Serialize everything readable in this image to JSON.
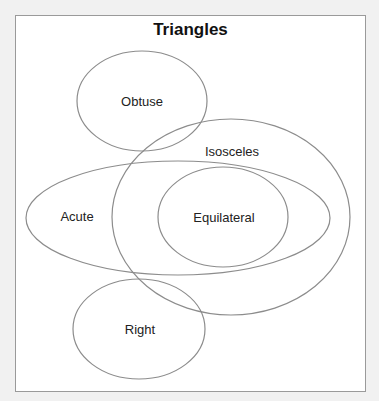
{
  "diagram": {
    "title": "Triangles",
    "type": "venn",
    "stroke_color": "#8c8c8c",
    "sets": [
      {
        "id": "obtuse",
        "label": "Obtuse",
        "cx": 142,
        "cy": 101,
        "rx": 65,
        "ry": 50,
        "label_x": 142,
        "label_y": 101
      },
      {
        "id": "isosceles",
        "label": "Isosceles",
        "cx": 231,
        "cy": 217,
        "rx": 119,
        "ry": 98,
        "label_x": 232,
        "label_y": 151
      },
      {
        "id": "acute",
        "label": "Acute",
        "cx": 178,
        "cy": 218,
        "rx": 152,
        "ry": 57,
        "label_x": 77,
        "label_y": 216
      },
      {
        "id": "equilateral",
        "label": "Equilateral",
        "cx": 223,
        "cy": 217,
        "rx": 65,
        "ry": 50,
        "label_x": 224,
        "label_y": 217
      },
      {
        "id": "right",
        "label": "Right",
        "cx": 139,
        "cy": 329,
        "rx": 66,
        "ry": 50,
        "label_x": 140,
        "label_y": 329
      }
    ]
  }
}
